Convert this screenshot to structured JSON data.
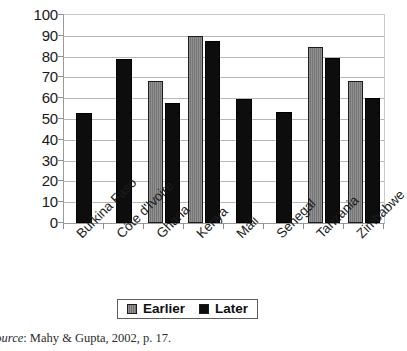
{
  "chart_data": {
    "type": "bar",
    "title": "",
    "subtitle": "",
    "xlabel": "",
    "ylabel": "",
    "ylim": [
      0,
      100
    ],
    "ytick_step": 10,
    "yticks": [
      "100",
      "90",
      "80",
      "70",
      "60",
      "50",
      "40",
      "30",
      "20",
      "10",
      "0"
    ],
    "grid": true,
    "grid_axis": "y",
    "legend_position": "bottom-center",
    "categories": [
      "Burkina Faso",
      "Côte d'Ivoire",
      "Ghana",
      "Kenya",
      "Mali",
      "Senegal",
      "Tanzania",
      "Zimbabwe"
    ],
    "series": [
      {
        "name": "Earlier",
        "color": "#7b7b7b",
        "values": [
          null,
          null,
          68.5,
          90,
          null,
          null,
          84.5,
          68.5
        ]
      },
      {
        "name": "Later",
        "color": "#0d0d0d",
        "values": [
          53,
          79,
          57.5,
          87.5,
          59.5,
          53.5,
          79.5,
          60
        ]
      }
    ]
  },
  "legend": {
    "entries": [
      {
        "label": "Earlier",
        "swatch": "earlier"
      },
      {
        "label": "Later",
        "swatch": "later"
      }
    ]
  },
  "caption": {
    "source_word": "Source",
    "source_text": ": Mahy & Gupta, 2002, p. 17."
  }
}
